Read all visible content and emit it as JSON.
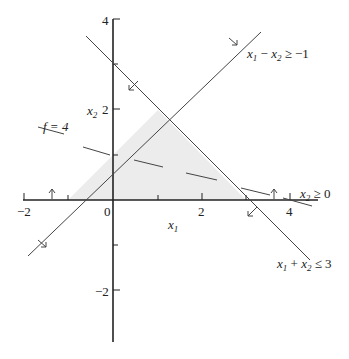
{
  "figure": {
    "type": "linear-programming-feasible-region",
    "axes": {
      "x_label": "x1",
      "y_label": "x2",
      "x_ticks": [
        {
          "value": -2,
          "label": "−2"
        },
        {
          "value": 0,
          "label": "0"
        },
        {
          "value": 2,
          "label": "2"
        },
        {
          "value": 4,
          "label": "4"
        }
      ],
      "y_ticks": [
        {
          "value": 4,
          "label": "4"
        },
        {
          "value": 2,
          "label": "2"
        },
        {
          "value": -2,
          "label": "−2"
        }
      ]
    },
    "constraints": [
      {
        "label_main": "x",
        "sub1": "1",
        "op": " − ",
        "var2": "x",
        "sub2": "2",
        "rel": " ≥ −1",
        "equation": "x1 - x2 >= -1"
      },
      {
        "label_main": "x",
        "sub1": "1",
        "op": " + ",
        "var2": "x",
        "sub2": "2",
        "rel": " ≤ 3",
        "equation": "x1 + x2 <= 3"
      },
      {
        "label_main": "x",
        "sub2": "2",
        "rel": " ≥ 0",
        "equation": "x2 >= 0"
      }
    ],
    "objective": {
      "label": "f = 4",
      "style": "dashed"
    },
    "feasible_region": {
      "vertices": [
        [
          -1,
          0
        ],
        [
          1,
          2
        ],
        [
          3,
          0
        ]
      ],
      "fill": "#ececec"
    },
    "colors": {
      "axis": "#222222",
      "line": "#444444",
      "fill": "#ececec"
    }
  }
}
